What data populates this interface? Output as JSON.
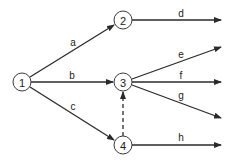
{
  "diagram": {
    "type": "activity-network",
    "nodes": [
      {
        "id": "1",
        "label": "1",
        "x": 22,
        "y": 82
      },
      {
        "id": "2",
        "label": "2",
        "x": 123,
        "y": 20
      },
      {
        "id": "3",
        "label": "3",
        "x": 123,
        "y": 82
      },
      {
        "id": "4",
        "label": "4",
        "x": 123,
        "y": 145
      }
    ],
    "edges": [
      {
        "label": "a",
        "from": "1",
        "to": "2",
        "style": "solid"
      },
      {
        "label": "b",
        "from": "1",
        "to": "3",
        "style": "solid"
      },
      {
        "label": "c",
        "from": "1",
        "to": "4",
        "style": "solid"
      },
      {
        "label": "d",
        "from": "2",
        "to": "out",
        "style": "solid"
      },
      {
        "label": "e",
        "from": "3",
        "to": "out",
        "style": "solid"
      },
      {
        "label": "f",
        "from": "3",
        "to": "out",
        "style": "solid"
      },
      {
        "label": "g",
        "from": "3",
        "to": "out",
        "style": "solid"
      },
      {
        "label": "h",
        "from": "4",
        "to": "out",
        "style": "solid"
      },
      {
        "label": "",
        "from": "4",
        "to": "3",
        "style": "dashed"
      }
    ]
  },
  "labels": {
    "n1": "1",
    "n2": "2",
    "n3": "3",
    "n4": "4",
    "a": "a",
    "b": "b",
    "c": "c",
    "d": "d",
    "e": "e",
    "f": "f",
    "g": "g",
    "h": "h"
  }
}
